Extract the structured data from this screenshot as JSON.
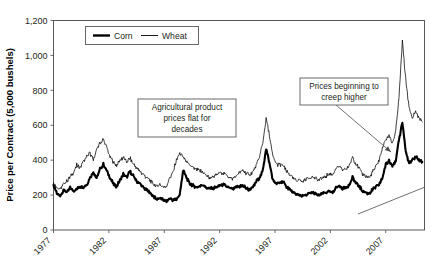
{
  "chart_data": {
    "type": "line",
    "title": "",
    "xlabel": "",
    "ylabel": "Price per Contract (5,000 bushels)",
    "ylim": [
      0,
      1200
    ],
    "yticks": [
      "0",
      "200",
      "400",
      "600",
      "800",
      "1,000",
      "1,200"
    ],
    "ytick_values": [
      0,
      200,
      400,
      600,
      800,
      1000,
      1200
    ],
    "xlim": [
      1977,
      2010.5
    ],
    "xticks": [
      "1977",
      "1982",
      "1987",
      "1992",
      "1997",
      "2002",
      "2007"
    ],
    "xtick_values": [
      1977,
      1982,
      1987,
      1992,
      1997,
      2002,
      2007
    ],
    "xtick_rotation": 45,
    "grid": false,
    "legend_position": "top-center",
    "legend": [
      {
        "name": "Corn",
        "style": "thick-line",
        "color": "#000000",
        "width": 2.1
      },
      {
        "name": "Wheat",
        "style": "thin-line",
        "color": "#000000",
        "width": 0.75
      }
    ],
    "series": [
      {
        "name": "Corn",
        "x": [
          1977.0,
          1977.3,
          1977.6,
          1977.9,
          1978.2,
          1978.5,
          1978.8,
          1979.1,
          1979.4,
          1979.7,
          1980.0,
          1980.3,
          1980.6,
          1980.9,
          1981.2,
          1981.5,
          1981.8,
          1982.1,
          1982.4,
          1982.7,
          1983.0,
          1983.3,
          1983.6,
          1983.9,
          1984.2,
          1984.5,
          1984.8,
          1985.1,
          1985.4,
          1985.7,
          1986.0,
          1986.3,
          1986.6,
          1986.9,
          1987.2,
          1987.5,
          1987.8,
          1988.1,
          1988.4,
          1988.7,
          1989.0,
          1989.3,
          1989.6,
          1989.9,
          1990.2,
          1990.5,
          1990.8,
          1991.1,
          1991.4,
          1991.7,
          1992.0,
          1992.3,
          1992.6,
          1992.9,
          1993.2,
          1993.5,
          1993.8,
          1994.1,
          1994.4,
          1994.7,
          1995.0,
          1995.3,
          1995.6,
          1995.9,
          1996.2,
          1996.5,
          1996.8,
          1997.1,
          1997.4,
          1997.7,
          1998.0,
          1998.3,
          1998.6,
          1998.9,
          1999.2,
          1999.5,
          1999.8,
          2000.1,
          2000.4,
          2000.7,
          2001.0,
          2001.3,
          2001.6,
          2001.9,
          2002.2,
          2002.5,
          2002.8,
          2003.1,
          2003.4,
          2003.7,
          2004.0,
          2004.3,
          2004.6,
          2004.9,
          2005.2,
          2005.5,
          2005.8,
          2006.1,
          2006.4,
          2006.7,
          2007.0,
          2007.3,
          2007.6,
          2007.9,
          2008.2,
          2008.5,
          2008.8,
          2009.1,
          2009.4,
          2009.7,
          2010.0,
          2010.3
        ],
        "y": [
          255,
          210,
          195,
          230,
          215,
          240,
          225,
          235,
          250,
          245,
          260,
          300,
          330,
          295,
          350,
          375,
          340,
          300,
          265,
          250,
          285,
          320,
          300,
          335,
          310,
          280,
          265,
          245,
          230,
          215,
          195,
          175,
          185,
          170,
          165,
          180,
          170,
          175,
          200,
          340,
          300,
          265,
          255,
          245,
          250,
          260,
          245,
          235,
          240,
          245,
          255,
          260,
          250,
          240,
          235,
          245,
          250,
          255,
          240,
          230,
          245,
          275,
          300,
          340,
          470,
          380,
          290,
          265,
          270,
          280,
          250,
          235,
          215,
          205,
          200,
          195,
          200,
          210,
          215,
          205,
          200,
          210,
          215,
          220,
          215,
          245,
          250,
          240,
          245,
          255,
          300,
          270,
          250,
          225,
          215,
          210,
          230,
          245,
          260,
          300,
          375,
          400,
          370,
          390,
          520,
          620,
          450,
          380,
          400,
          420,
          400,
          390
        ]
      },
      {
        "name": "Wheat",
        "x": [
          1977.0,
          1977.3,
          1977.6,
          1977.9,
          1978.2,
          1978.5,
          1978.8,
          1979.1,
          1979.4,
          1979.7,
          1980.0,
          1980.3,
          1980.6,
          1980.9,
          1981.2,
          1981.5,
          1981.8,
          1982.1,
          1982.4,
          1982.7,
          1983.0,
          1983.3,
          1983.6,
          1983.9,
          1984.2,
          1984.5,
          1984.8,
          1985.1,
          1985.4,
          1985.7,
          1986.0,
          1986.3,
          1986.6,
          1986.9,
          1987.2,
          1987.5,
          1987.8,
          1988.1,
          1988.4,
          1988.7,
          1989.0,
          1989.3,
          1989.6,
          1989.9,
          1990.2,
          1990.5,
          1990.8,
          1991.1,
          1991.4,
          1991.7,
          1992.0,
          1992.3,
          1992.6,
          1992.9,
          1993.2,
          1993.5,
          1993.8,
          1994.1,
          1994.4,
          1994.7,
          1995.0,
          1995.3,
          1995.6,
          1995.9,
          1996.2,
          1996.5,
          1996.8,
          1997.1,
          1997.4,
          1997.7,
          1998.0,
          1998.3,
          1998.6,
          1998.9,
          1999.2,
          1999.5,
          1999.8,
          2000.1,
          2000.4,
          2000.7,
          2001.0,
          2001.3,
          2001.6,
          2001.9,
          2002.2,
          2002.5,
          2002.8,
          2003.1,
          2003.4,
          2003.7,
          2004.0,
          2004.3,
          2004.6,
          2004.9,
          2005.2,
          2005.5,
          2005.8,
          2006.1,
          2006.4,
          2006.7,
          2007.0,
          2007.3,
          2007.6,
          2007.9,
          2008.2,
          2008.5,
          2008.8,
          2009.1,
          2009.4,
          2009.7,
          2010.0,
          2010.3
        ],
        "y": [
          265,
          245,
          235,
          260,
          280,
          300,
          330,
          370,
          355,
          395,
          420,
          440,
          400,
          460,
          500,
          520,
          470,
          420,
          390,
          370,
          400,
          415,
          390,
          410,
          380,
          355,
          335,
          320,
          300,
          285,
          265,
          250,
          260,
          245,
          250,
          300,
          330,
          400,
          435,
          420,
          390,
          370,
          355,
          345,
          340,
          330,
          310,
          300,
          305,
          315,
          330,
          325,
          315,
          300,
          295,
          310,
          330,
          340,
          325,
          315,
          330,
          370,
          420,
          500,
          640,
          540,
          420,
          380,
          370,
          375,
          340,
          320,
          295,
          285,
          290,
          275,
          290,
          300,
          305,
          295,
          285,
          300,
          310,
          320,
          315,
          350,
          365,
          345,
          350,
          365,
          420,
          380,
          350,
          320,
          310,
          300,
          330,
          360,
          400,
          470,
          520,
          540,
          500,
          560,
          760,
          1080,
          870,
          700,
          640,
          680,
          640,
          620
        ]
      }
    ],
    "annotations": [
      {
        "id": "flat-prices",
        "lines": [
          "Agricultural product",
          "prices flat for",
          "decades"
        ],
        "box": {
          "x": 138,
          "y": 99,
          "w": 98,
          "h": 38
        },
        "has_arrow": false
      },
      {
        "id": "creep-higher",
        "lines": [
          "Prices beginning to",
          "creep higher"
        ],
        "box": {
          "x": 300,
          "y": 78,
          "w": 88,
          "h": 27
        },
        "has_arrow": true,
        "arrow_from": {
          "x": 336,
          "y": 105
        },
        "arrow_to": {
          "x": 391,
          "y": 152
        }
      }
    ],
    "trend_line": {
      "from": {
        "x": 358,
        "y": 214
      },
      "to": {
        "x": 425,
        "y": 187
      }
    }
  }
}
